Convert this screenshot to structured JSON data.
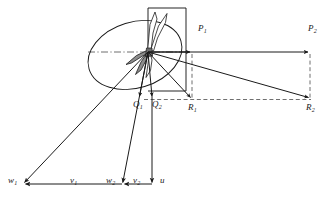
{
  "figure": {
    "background_color": "#ffffff",
    "stroke_color": "#1a1a1a",
    "blade_fill_color": "#8c8c8c",
    "width": 330,
    "height": 207
  },
  "labels": {
    "p1": {
      "text": "P",
      "sub": "1",
      "x": 198,
      "y": 30
    },
    "p2": {
      "text": "P",
      "sub": "2",
      "x": 309,
      "y": 30
    },
    "r1": {
      "text": "R",
      "sub": "1",
      "x": 197,
      "y": 108
    },
    "r2": {
      "text": "R",
      "sub": "2",
      "x": 307,
      "y": 108
    },
    "q1": {
      "text": "Q",
      "sub": "1",
      "x": 134,
      "y": 104
    },
    "q2": {
      "text": "Q",
      "sub": "2",
      "x": 152,
      "y": 104
    },
    "w1": {
      "text": "w",
      "sub": "1",
      "x": 8,
      "y": 175
    },
    "v1": {
      "text": "v",
      "sub": "1",
      "x": 71,
      "y": 175
    },
    "w2": {
      "text": "w",
      "sub": "2",
      "x": 107,
      "y": 175
    },
    "v2": {
      "text": "v",
      "sub": "2",
      "x": 134,
      "y": 175
    },
    "u": {
      "text": "u",
      "sub": "",
      "x": 161,
      "y": 175
    }
  },
  "geometry": {
    "hub": {
      "x": 148,
      "y": 52
    },
    "disc_ellipse": {
      "cx": 135,
      "cy": 55,
      "rx": 48,
      "ry": 33,
      "rotation": -18
    },
    "axis_line": {
      "x1": 88,
      "y1": 52,
      "x2": 186,
      "y2": 52
    },
    "rect_panel": {
      "x1": 148,
      "y1": 8,
      "x2": 186,
      "y2": 91
    },
    "p1_point": {
      "x": 192,
      "y": 52
    },
    "p2_point": {
      "x": 310,
      "y": 52
    },
    "r1_point": {
      "x": 192,
      "y": 99
    },
    "r2_point": {
      "x": 310,
      "y": 99
    },
    "q1_point": {
      "x": 139,
      "y": 99
    },
    "q2_point": {
      "x": 152,
      "y": 99
    },
    "w1_tip": {
      "x": 23,
      "y": 184
    },
    "w2_tip": {
      "x": 122,
      "y": 184
    },
    "baseline_y": 184
  },
  "vectors": [
    {
      "name": "P1",
      "from": "hub",
      "to": "p1_point",
      "style": "solid-arrow"
    },
    {
      "name": "P2",
      "from": "hub",
      "to": "p2_point",
      "style": "solid-arrow"
    },
    {
      "name": "R1",
      "from": "hub",
      "to": "r1_point",
      "style": "solid-arrow"
    },
    {
      "name": "R2",
      "from": "hub",
      "to": "r2_point",
      "style": "solid-arrow"
    },
    {
      "name": "Q1",
      "from": "hub",
      "to": "q1_point",
      "style": "solid-arrow"
    },
    {
      "name": "Q2",
      "from": "hub",
      "to": "q2_point",
      "style": "solid-arrow"
    },
    {
      "name": "w1",
      "from": "hub",
      "to": "w1_tip",
      "style": "solid-arrow"
    },
    {
      "name": "w2",
      "from": "hub",
      "to": "w2_tip",
      "style": "solid-arrow"
    },
    {
      "name": "u",
      "from": "hub_base",
      "to": "baseline",
      "style": "solid-arrow"
    },
    {
      "name": "v1",
      "from": "baseline-right",
      "to": "w1_tip",
      "style": "solid-arrow"
    },
    {
      "name": "v2",
      "from": "baseline-right",
      "to": "w2_tip",
      "style": "solid-arrow"
    }
  ],
  "dashed_lines": [
    {
      "name": "p1-r1-vertical",
      "x1": 192,
      "y1": 52,
      "x2": 192,
      "y2": 99
    },
    {
      "name": "p2-r2-vertical",
      "x1": 310,
      "y1": 52,
      "x2": 310,
      "y2": 99
    },
    {
      "name": "q-r-horizontal",
      "x1": 145,
      "y1": 99,
      "x2": 310,
      "y2": 99
    }
  ]
}
